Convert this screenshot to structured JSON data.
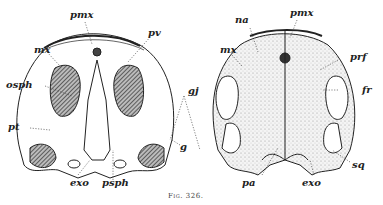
{
  "figure": {
    "caption": "Fig. 326.",
    "panels": [
      {
        "view": "ventral",
        "labels": {
          "pmx": "pmx",
          "pv": "pv",
          "mx": "mx",
          "osph": "osph",
          "pt": "pt",
          "g": "g",
          "exo": "exo",
          "psph": "psph"
        }
      },
      {
        "view": "dorsal",
        "labels": {
          "na": "na",
          "pmx": "pmx",
          "mx": "mx",
          "prf": "prf",
          "fr": "fr",
          "sq": "sq",
          "pa": "pa",
          "exo": "exo"
        }
      }
    ],
    "shared_labels": {
      "gj": "gj"
    }
  }
}
